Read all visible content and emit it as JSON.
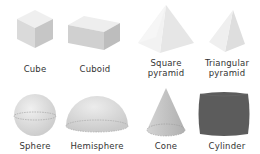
{
  "shapes": [
    {
      "name": "Cube",
      "row": 1,
      "col": 1
    },
    {
      "name": "Cuboid",
      "row": 1,
      "col": 2
    },
    {
      "name": "Square pyramid",
      "line1": "Square",
      "line2": "pyramid",
      "row": 1,
      "col": 3
    },
    {
      "name": "Triangular pyramid",
      "line1": "Triangular",
      "line2": "pyramid",
      "row": 1,
      "col": 4
    },
    {
      "name": "Sphere",
      "row": 2,
      "col": 1
    },
    {
      "name": "Hemisphere",
      "row": 2,
      "col": 2
    },
    {
      "name": "Cone",
      "row": 2,
      "col": 3
    },
    {
      "name": "Cylinder",
      "row": 2,
      "col": 4
    }
  ],
  "colors": {
    "light_top": "#f0f0f0",
    "light_face": "#e2e2e2",
    "mid_face": "#cfcfcf",
    "dark_face": "#bcbcbc",
    "cylinder": "#5a5a5a",
    "label_text": "#333333"
  }
}
